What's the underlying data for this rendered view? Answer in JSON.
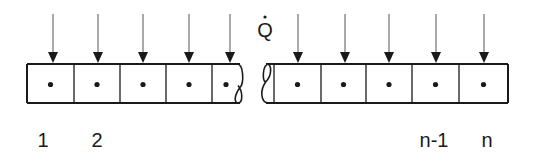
{
  "diagram": {
    "heat_symbol": "Q",
    "heat_symbol_dotted": true,
    "colors": {
      "stroke": "#1a1a1a",
      "arrow_line": "#555555",
      "background": "#ffffff"
    },
    "left_segment": {
      "cells": 5,
      "x_edges": [
        27,
        74,
        120,
        166,
        212
      ],
      "wavy_end_x": 240,
      "arrow_x": [
        53,
        98,
        143,
        189,
        230
      ]
    },
    "right_segment": {
      "cells": 5,
      "wavy_start_x": 266,
      "x_edges": [
        274,
        321,
        366,
        412,
        459,
        508
      ],
      "arrow_x": [
        298,
        345,
        389,
        436,
        484
      ]
    },
    "box": {
      "top": 64,
      "bottom": 103
    },
    "labels": [
      {
        "text": "1",
        "x": 43
      },
      {
        "text": "2",
        "x": 97
      },
      {
        "text": "n-1",
        "x": 434
      },
      {
        "text": "n",
        "x": 487
      }
    ]
  }
}
